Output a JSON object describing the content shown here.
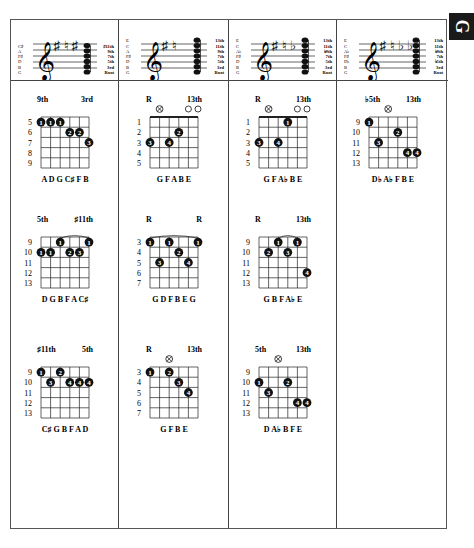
{
  "section_tab": {
    "letter": "G"
  },
  "columns": [
    {
      "staff": {
        "left_labels": [
          "C♯",
          "A",
          "F♯",
          "D",
          "B",
          "G"
        ],
        "right_labels": [
          "♯11th",
          "9th",
          "7th",
          "5th",
          "3rd",
          "Root"
        ],
        "accidentals": [
          "♯",
          "♮",
          "♯"
        ]
      },
      "chords": [
        {
          "top_left": "9th",
          "top_right": "3rd",
          "frets": [
            5,
            6,
            7,
            8,
            9
          ],
          "nut": false,
          "markers": [],
          "notes": "A D G C♯ F B",
          "dots": [
            {
              "s": 1,
              "f": 0,
              "n": "1"
            },
            {
              "s": 2,
              "f": 0,
              "n": "1"
            },
            {
              "s": 3,
              "f": 0,
              "n": "1"
            },
            {
              "s": 4,
              "f": 1,
              "n": "2"
            },
            {
              "s": 5,
              "f": 1,
              "n": "2"
            },
            {
              "s": 6,
              "f": 2,
              "n": "3"
            }
          ]
        },
        {
          "top_left": "5th",
          "top_right": "♯11th",
          "frets": [
            9,
            10,
            11,
            12,
            13
          ],
          "nut": false,
          "markers": [],
          "notes": "D G B F A C♯",
          "barre": {
            "from": 3,
            "to": 6,
            "f": 0
          },
          "dots": [
            {
              "s": 1,
              "f": 1,
              "n": "1"
            },
            {
              "s": 2,
              "f": 1,
              "n": "1"
            },
            {
              "s": 3,
              "f": 0,
              "n": "1"
            },
            {
              "s": 4,
              "f": 1,
              "n": "2"
            },
            {
              "s": 5,
              "f": 1,
              "n": "3"
            },
            {
              "s": 6,
              "f": 0,
              "n": "1"
            }
          ]
        },
        {
          "top_left": "♯11th",
          "top_right": "5th",
          "frets": [
            9,
            10,
            11,
            12,
            13
          ],
          "nut": false,
          "markers": [],
          "notes": "C♯ G B F A D",
          "dots": [
            {
              "s": 1,
              "f": 0,
              "n": "1"
            },
            {
              "s": 2,
              "f": 1,
              "n": "3"
            },
            {
              "s": 3,
              "f": 0,
              "n": "2"
            },
            {
              "s": 4,
              "f": 1,
              "n": "4"
            },
            {
              "s": 5,
              "f": 1,
              "n": "4"
            },
            {
              "s": 6,
              "f": 1,
              "n": "4"
            }
          ]
        }
      ]
    },
    {
      "staff": {
        "left_labels": [
          "E",
          "C",
          "A",
          "F♯",
          "D",
          "B",
          "G"
        ],
        "right_labels": [
          "13th",
          "11th",
          "9th",
          "7th",
          "5th",
          "3rd",
          "Root"
        ],
        "accidentals": [
          "♯",
          "♮"
        ]
      },
      "chords": [
        {
          "top_left": "R",
          "top_right": "13th",
          "frets": [
            1,
            2,
            3,
            4,
            5
          ],
          "nut": true,
          "markers": [
            {
              "s": 2,
              "t": "x"
            },
            {
              "s": 5,
              "t": "o"
            },
            {
              "s": 6,
              "t": "o"
            }
          ],
          "notes": "G   F A B E",
          "dots": [
            {
              "s": 1,
              "f": 2,
              "n": "3"
            },
            {
              "s": 3,
              "f": 2,
              "n": "4"
            },
            {
              "s": 4,
              "f": 1,
              "n": "2"
            }
          ]
        },
        {
          "top_left": "R",
          "top_right": "R",
          "frets": [
            3,
            4,
            5,
            6,
            7
          ],
          "nut": false,
          "markers": [],
          "notes": "G D F B E G",
          "barre": {
            "from": 1,
            "to": 6,
            "f": 0
          },
          "dots": [
            {
              "s": 1,
              "f": 0,
              "n": "1"
            },
            {
              "s": 2,
              "f": 2,
              "n": "3"
            },
            {
              "s": 3,
              "f": 0,
              "n": "1"
            },
            {
              "s": 4,
              "f": 1,
              "n": "2"
            },
            {
              "s": 5,
              "f": 2,
              "n": "4"
            },
            {
              "s": 6,
              "f": 0,
              "n": "1"
            }
          ]
        },
        {
          "top_left": "R",
          "top_right": "13th",
          "frets": [
            3,
            4,
            5,
            6,
            7
          ],
          "nut": false,
          "markers": [
            {
              "s": 3,
              "t": "x"
            }
          ],
          "notes": "G   F B E",
          "dots": [
            {
              "s": 1,
              "f": 0,
              "n": "1"
            },
            {
              "s": 3,
              "f": 0,
              "n": "2"
            },
            {
              "s": 4,
              "f": 1,
              "n": "3"
            },
            {
              "s": 5,
              "f": 2,
              "n": "4"
            }
          ]
        }
      ]
    },
    {
      "staff": {
        "left_labels": [
          "E",
          "C",
          "A♭",
          "F♯",
          "D",
          "B",
          "G"
        ],
        "right_labels": [
          "13th",
          "11th",
          "♭9th",
          "7th",
          "5th",
          "3rd",
          "Root"
        ],
        "accidentals": [
          "♯",
          "♮",
          "♭"
        ]
      },
      "chords": [
        {
          "top_left": "R",
          "top_right": "13th",
          "frets": [
            1,
            2,
            3,
            4,
            5
          ],
          "nut": true,
          "markers": [
            {
              "s": 2,
              "t": "x"
            },
            {
              "s": 5,
              "t": "o"
            },
            {
              "s": 6,
              "t": "o"
            }
          ],
          "notes": "G   F A♭ B E",
          "dots": [
            {
              "s": 1,
              "f": 2,
              "n": "3"
            },
            {
              "s": 3,
              "f": 2,
              "n": "4"
            },
            {
              "s": 4,
              "f": 0,
              "n": "1"
            }
          ]
        },
        {
          "top_left": "R",
          "top_right": "13th",
          "frets": [
            9,
            10,
            11,
            12,
            13
          ],
          "nut": false,
          "markers": [],
          "notes": "G B F A♭ E",
          "barre": {
            "from": 3,
            "to": 5,
            "f": 0
          },
          "dots": [
            {
              "s": 2,
              "f": 1,
              "n": "2"
            },
            {
              "s": 3,
              "f": 0,
              "n": "1"
            },
            {
              "s": 4,
              "f": 1,
              "n": "3"
            },
            {
              "s": 5,
              "f": 0,
              "n": "1"
            },
            {
              "s": 6,
              "f": 3,
              "n": "4"
            }
          ]
        },
        {
          "top_left": "5th",
          "top_right": "13th",
          "frets": [
            9,
            10,
            11,
            12,
            13
          ],
          "nut": false,
          "markers": [
            {
              "s": 3,
              "t": "x"
            }
          ],
          "notes": "D A♭   B F E",
          "dots": [
            {
              "s": 1,
              "f": 1,
              "n": "1"
            },
            {
              "s": 2,
              "f": 2,
              "n": "3"
            },
            {
              "s": 4,
              "f": 1,
              "n": "2"
            },
            {
              "s": 5,
              "f": 3,
              "n": "4"
            },
            {
              "s": 6,
              "f": 3,
              "n": "4"
            }
          ]
        }
      ]
    },
    {
      "staff": {
        "left_labels": [
          "E",
          "C",
          "A♭",
          "F♯",
          "D♭",
          "B",
          "G"
        ],
        "right_labels": [
          "13th",
          "11th",
          "♭9th",
          "7th",
          "♭5th",
          "3rd",
          "Root"
        ],
        "accidentals": [
          "♯",
          "♮",
          "♭",
          "♭"
        ]
      },
      "chords": [
        {
          "top_left": "♭5th",
          "top_right": "13th",
          "frets": [
            9,
            10,
            11,
            12,
            13
          ],
          "nut": false,
          "markers": [
            {
              "s": 3,
              "t": "x"
            }
          ],
          "notes": "D♭ A♭   F B E",
          "dots": [
            {
              "s": 1,
              "f": 0,
              "n": "1"
            },
            {
              "s": 2,
              "f": 2,
              "n": "3"
            },
            {
              "s": 4,
              "f": 1,
              "n": "2"
            },
            {
              "s": 5,
              "f": 3,
              "n": "4"
            },
            {
              "s": 6,
              "f": 3,
              "n": "4"
            }
          ]
        }
      ]
    }
  ]
}
